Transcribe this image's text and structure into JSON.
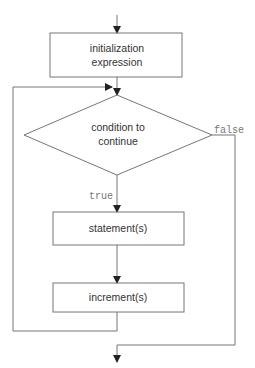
{
  "diagram": {
    "type": "flowchart",
    "nodes": {
      "init": {
        "shape": "rectangle",
        "line1": "initialization",
        "line2": "expression"
      },
      "condition": {
        "shape": "diamond",
        "line1": "condition to",
        "line2": "continue"
      },
      "statements": {
        "shape": "rectangle",
        "label": "statement(s)"
      },
      "increment": {
        "shape": "rectangle",
        "label": "increment(s)"
      }
    },
    "edges": {
      "true_label": "true",
      "false_label": "false"
    },
    "colors": {
      "stroke": "#666666",
      "text": "#333333",
      "edge_label": "#777777"
    }
  }
}
